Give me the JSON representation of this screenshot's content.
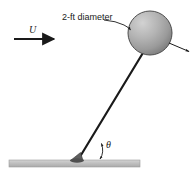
{
  "figure": {
    "name": "sphere-on-cable-in-flow-diagram",
    "background_color": "#ffffff",
    "width": 193,
    "height": 178
  },
  "annotations": {
    "diameter_label": "2-ft diameter",
    "velocity_symbol": "U",
    "angle_symbol": "θ"
  },
  "elements": {
    "sphere": {
      "name": "sphere",
      "center_x": 150,
      "center_y": 33,
      "radius": 22,
      "fill_light": "#c8c8c8",
      "fill_dark": "#8a8a8a",
      "stroke": "#4a4a4a"
    },
    "cable": {
      "name": "cable",
      "x1": 78,
      "y1": 160,
      "x2": 143,
      "y2": 52,
      "stroke": "#1a1a1a",
      "width": 2.2
    },
    "ground": {
      "name": "ground-surface",
      "x": 9,
      "y": 160,
      "width": 131,
      "height": 7,
      "fill": "#bdbdbd",
      "stroke": "#9a9a9a"
    },
    "flow_arrow": {
      "name": "flow-arrow",
      "x1": 14,
      "y1": 39,
      "x2": 56,
      "y2": 39,
      "color": "#1a1a1a"
    },
    "force_arrow": {
      "name": "force-arrow",
      "x1": 168,
      "y1": 43,
      "x2": 188,
      "y2": 51,
      "color": "#1a1a1a"
    },
    "angle_arc": {
      "name": "angle-arc",
      "color": "#1a1a1a"
    },
    "leader_line": {
      "name": "diameter-leader-line",
      "color": "#1a1a1a"
    },
    "pivot": {
      "name": "pivot-anchor",
      "fill": "#5a5a5a"
    }
  }
}
